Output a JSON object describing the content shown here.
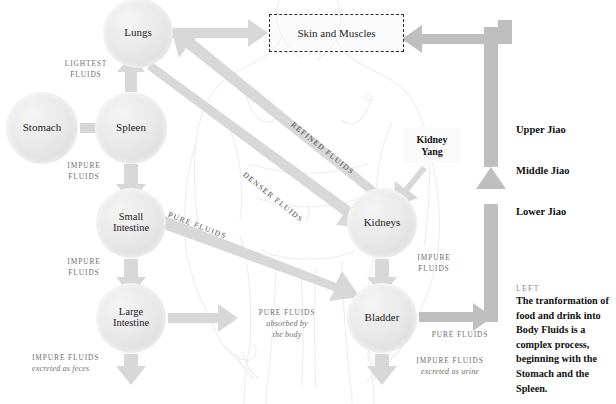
{
  "diagram": {
    "nodes": [
      {
        "id": "stomach",
        "label": "Stomach",
        "cx": 42,
        "cy": 128,
        "r": 36
      },
      {
        "id": "spleen",
        "label": "Spleen",
        "cx": 131,
        "cy": 128,
        "r": 36
      },
      {
        "id": "lungs",
        "label": "Lungs",
        "cx": 138,
        "cy": 33,
        "r": 35
      },
      {
        "id": "small-intestine",
        "label": "Small\nIntestine",
        "cx": 131,
        "cy": 223,
        "r": 35
      },
      {
        "id": "large-intestine",
        "label": "Large\nIntestine",
        "cx": 131,
        "cy": 318,
        "r": 35
      },
      {
        "id": "kidneys",
        "label": "Kidneys",
        "cx": 382,
        "cy": 223,
        "r": 35
      },
      {
        "id": "bladder",
        "label": "Bladder",
        "cx": 382,
        "cy": 318,
        "r": 35
      }
    ],
    "skin_box": {
      "label": "Skin and Muscles"
    },
    "kidney_yang": {
      "label": "Kidney\nYang"
    },
    "edge_labels": [
      {
        "id": "lightest-fluids",
        "text": "LIGHTEST\nFLUIDS"
      },
      {
        "id": "impure-fluids-spleen",
        "text": "IMPURE\nFLUIDS"
      },
      {
        "id": "impure-fluids-si",
        "text": "IMPURE\nFLUIDS"
      },
      {
        "id": "impure-fluids-feces",
        "text": "IMPURE FLUIDS",
        "sub": "excreted as feces"
      },
      {
        "id": "pure-fluids-body",
        "text": "PURE FLUIDS",
        "sub": "absorbed by\nthe body"
      },
      {
        "id": "impure-fluids-kidney",
        "text": "IMPURE\nFLUIDS"
      },
      {
        "id": "pure-fluids-bladder",
        "text": "PURE FLUIDS"
      },
      {
        "id": "impure-fluids-urine",
        "text": "IMPURE FLUIDS",
        "sub": "excreted as urine"
      },
      {
        "id": "refined-fluids",
        "text": "REFINED FLUIDS"
      },
      {
        "id": "denser-fluids",
        "text": "DENSER FLUIDS"
      },
      {
        "id": "pure-fluids-si",
        "text": "PURE FLUIDS"
      }
    ],
    "jiao": [
      {
        "id": "upper-jiao",
        "label": "Upper Jiao",
        "top": 124
      },
      {
        "id": "middle-jiao",
        "label": "Middle Jiao",
        "top": 165
      },
      {
        "id": "lower-jiao",
        "label": "Lower Jiao",
        "top": 206
      }
    ],
    "caption": {
      "kicker": "LEFT",
      "body": "The tranformation of food and drink into Body Fluids is a complex process, beginning with the Stomach and the Spleen."
    },
    "colors": {
      "arrow": "#d8d8d8",
      "arrow_dark": "#bdbdbd",
      "node_fill": "#e7e7e7",
      "label_text": "#6e6e6e",
      "heading_text": "#111111",
      "background": "#ffffff"
    }
  }
}
